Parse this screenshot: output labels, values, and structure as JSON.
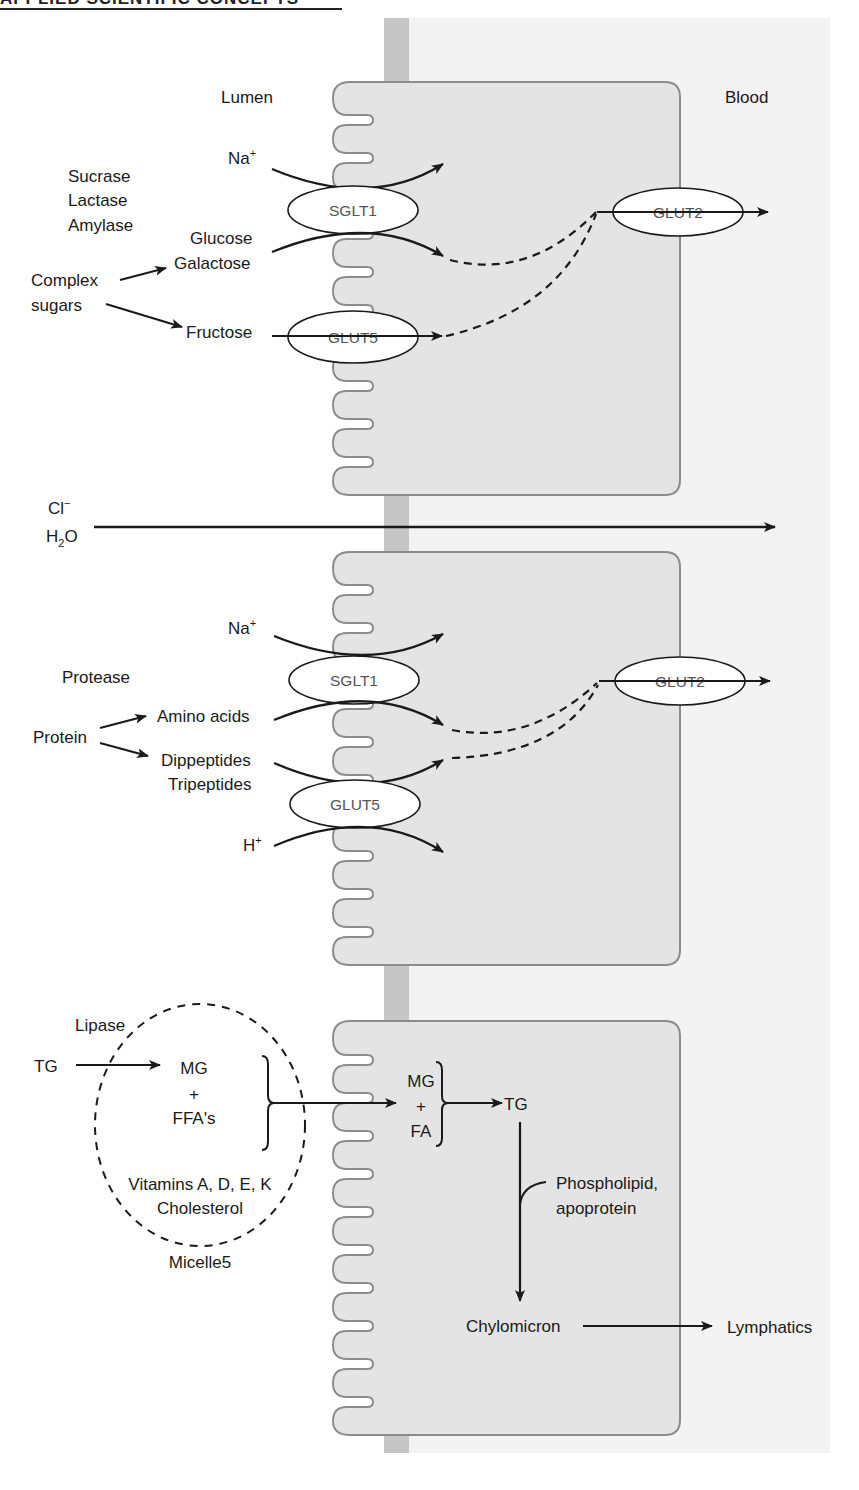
{
  "header": {
    "title": "APPLIED SCIENTIFIC CONCEPTS"
  },
  "regions": {
    "lumen": "Lumen",
    "blood": "Blood"
  },
  "carbohydrate": {
    "na_ion": "Na",
    "na_charge": "+",
    "enzymes": [
      "Sucrase",
      "Lactase",
      "Amylase"
    ],
    "substrate": [
      "Complex",
      "sugars"
    ],
    "products": [
      "Glucose",
      "Galactose"
    ],
    "fructose": "Fructose",
    "apical_transporter_1": "SGLT1",
    "apical_transporter_2": "GLUT5",
    "basolateral_transporter": "GLUT2"
  },
  "paracellular": {
    "ion": "Cl",
    "ion_charge": "−",
    "water_h": "H",
    "water_sub": "2",
    "water_o": "O"
  },
  "protein": {
    "na_ion": "Na",
    "na_charge": "+",
    "enzyme": "Protease",
    "substrate": "Protein",
    "product_1": "Amino acids",
    "product_2": [
      "Dippeptides",
      "Tripeptides"
    ],
    "h_ion": "H",
    "h_charge": "+",
    "apical_transporter_1": "SGLT1",
    "apical_transporter_2": "GLUT5",
    "basolateral_transporter": "GLUT2"
  },
  "lipid": {
    "enzyme": "Lipase",
    "substrate": "TG",
    "lumen_products": [
      "MG",
      "+",
      "FFA's"
    ],
    "micelle_contents": [
      "Vitamins A, D, E, K",
      "Cholesterol"
    ],
    "micelle_label": "Micelle5",
    "cell_products": [
      "MG",
      "+",
      "FA"
    ],
    "resynthesized": "TG",
    "additives": [
      "Phospholipid,",
      "apoprotein"
    ],
    "packaged": "Chylomicron",
    "destination": "Lymphatics"
  },
  "colors": {
    "cell_fill": "#e4e4e4",
    "cell_stroke": "#8c8c8c",
    "blood_bg": "#f3f3f3",
    "junction": "#c6c6c6",
    "ink": "#1a1a1a"
  }
}
